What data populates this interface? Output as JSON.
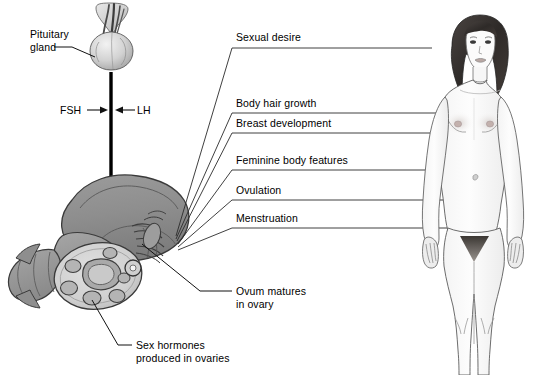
{
  "diagram": {
    "colors": {
      "line": "#1a1a1a",
      "organ_dark": "#8c8c8c",
      "organ_mid": "#a8a8a8",
      "organ_light": "#cfcfcf",
      "ovary_fill": "#d8d8d8",
      "follicle": "#9a9a9a",
      "skin": "#fbfbfb",
      "hair": "#3a3a3a",
      "background": "#ffffff"
    },
    "labels": {
      "pituitary": "Pituitary\ngland",
      "pituitary_line1": "Pituitary",
      "pituitary_line2": "gland",
      "fsh": "FSH",
      "lh": "LH",
      "sexual_desire": "Sexual desire",
      "body_hair_growth": "Body hair growth",
      "breast_development": "Breast development",
      "feminine_body_features": "Feminine body features",
      "ovulation": "Ovulation",
      "menstruation": "Menstruation",
      "ovum_line1": "Ovum matures",
      "ovum_line2": "in ovary",
      "sex_hormones_line1": "Sex hormones",
      "sex_hormones_line2": "produced in ovaries"
    },
    "icons": {
      "pituitary": "pituitary-gland-icon",
      "ovary": "ovary-icon",
      "uterus": "uterus-icon",
      "female_body": "female-body-icon",
      "down_arrow": "down-arrow-icon",
      "fsh_arrow": "fsh-arrow-icon",
      "lh_arrow": "lh-arrow-icon"
    },
    "callouts": [
      {
        "key": "sexual_desire",
        "text": "Sexual desire",
        "line_y": 47,
        "target": "head"
      },
      {
        "key": "body_hair_growth",
        "text": "Body hair growth",
        "line_y": 112,
        "target": "underarm"
      },
      {
        "key": "breast_development",
        "text": "Breast development",
        "line_y": 132,
        "target": "breast"
      },
      {
        "key": "feminine_body_features",
        "text": "Feminine body features",
        "line_y": 169,
        "target": "hip"
      },
      {
        "key": "ovulation",
        "text": "Ovulation",
        "line_y": 199,
        "target": "pelvis"
      },
      {
        "key": "menstruation",
        "text": "Menstruation",
        "line_y": 227,
        "target": "pubis"
      }
    ]
  }
}
